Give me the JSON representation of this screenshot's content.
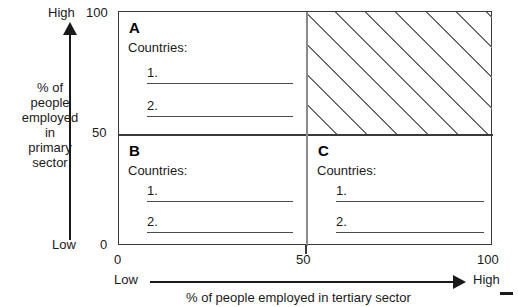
{
  "chart_data": {
    "type": "scatter",
    "title": "",
    "xlabel": "% of people employed in tertiary sector",
    "ylabel": "% of people employed in primary sector",
    "xlim": [
      0,
      100
    ],
    "ylim": [
      0,
      100
    ],
    "xticks": [
      "0",
      "50",
      "100"
    ],
    "yticks": [
      "0",
      "50",
      "100"
    ],
    "x_low_label": "Low",
    "x_high_label": "High",
    "y_low_label": "Low",
    "y_high_label": "High",
    "grid": false,
    "legend": "none",
    "quadrants": [
      {
        "id": "A",
        "letter": "A",
        "position": "top-left",
        "x_range": [
          0,
          50
        ],
        "y_range": [
          50,
          100
        ],
        "hatched": false,
        "heading": "Countries:",
        "entries": [
          "1.",
          "2."
        ],
        "values": [
          "",
          ""
        ]
      },
      {
        "id": "hatched",
        "letter": "",
        "position": "top-right",
        "x_range": [
          50,
          100
        ],
        "y_range": [
          50,
          100
        ],
        "hatched": true,
        "heading": "",
        "entries": [],
        "values": []
      },
      {
        "id": "B",
        "letter": "B",
        "position": "bottom-left",
        "x_range": [
          0,
          50
        ],
        "y_range": [
          0,
          50
        ],
        "hatched": false,
        "heading": "Countries:",
        "entries": [
          "1.",
          "2."
        ],
        "values": [
          "",
          ""
        ]
      },
      {
        "id": "C",
        "letter": "C",
        "position": "bottom-right",
        "x_range": [
          50,
          100
        ],
        "y_range": [
          0,
          50
        ],
        "hatched": false,
        "heading": "Countries:",
        "entries": [
          "1.",
          "2."
        ],
        "values": [
          "",
          ""
        ]
      }
    ],
    "annotations": []
  },
  "y_axis": {
    "high_label": "High",
    "low_label": "Low",
    "title_lines": "% of\npeople\nemployed\nin\nprimary\nsector",
    "title_flat": "% of people employed in primary sector",
    "tick_100": "100",
    "tick_50": "50",
    "tick_0": "0"
  },
  "x_axis": {
    "low_label": "Low",
    "high_label": "High",
    "title": "% of people employed in tertiary sector",
    "tick_0": "0",
    "tick_50": "50",
    "tick_100": "100"
  },
  "quadrant_a": {
    "letter": "A",
    "heading": "Countries:",
    "entry_1": "1.",
    "entry_2": "2."
  },
  "quadrant_b": {
    "letter": "B",
    "heading": "Countries:",
    "entry_1": "1.",
    "entry_2": "2."
  },
  "quadrant_c": {
    "letter": "C",
    "heading": "Countries:",
    "entry_1": "1.",
    "entry_2": "2."
  },
  "colors": {
    "frame": "#3a3a3a",
    "hatch": "#6d6d6d",
    "text": "#1a1a1a",
    "rule": "#4a4a4a",
    "background": "#ffffff"
  }
}
